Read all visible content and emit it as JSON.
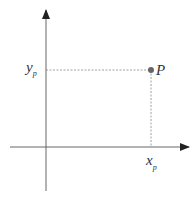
{
  "diagram": {
    "title": "",
    "point": {
      "label": "P",
      "x": 151,
      "y": 70
    },
    "x_projection_label": {
      "main": "x",
      "sub": "p"
    },
    "y_projection_label": {
      "main": "y",
      "sub": "p"
    },
    "colors": {
      "axis": "#555555",
      "dashed": "#888888",
      "point": "#666666",
      "text": "#333333"
    }
  }
}
